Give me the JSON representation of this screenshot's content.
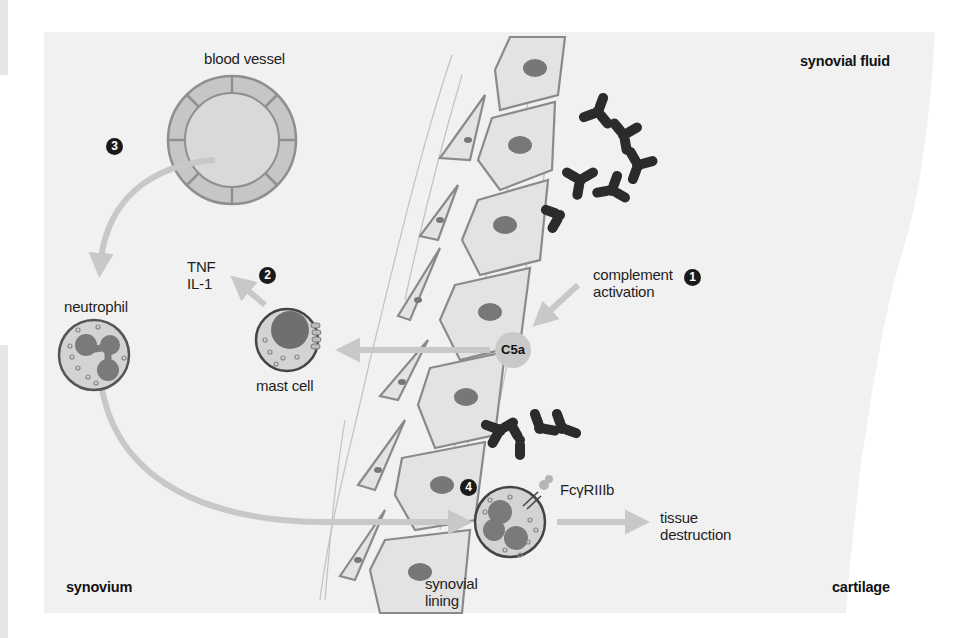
{
  "figure": {
    "regions": {
      "synovial_fluid": "synovial fluid",
      "synovium": "synovium",
      "cartilage": "cartilage",
      "synovial_lining": "synovial\nlining"
    },
    "structures": {
      "blood_vessel": "blood vessel",
      "neutrophil": "neutrophil",
      "mast_cell": "mast cell",
      "cytokines": "TNF\nIL-1",
      "complement_activation": "complement\nactivation",
      "c5a": "C5a",
      "receptor": "FcγRIIIb",
      "tissue_destruction": "tissue\ndestruction"
    },
    "steps": [
      "1",
      "2",
      "3",
      "4"
    ],
    "icons": {
      "immune_complex_upper": "antibody-immune-complex-icon",
      "immune_complex_lower": "antibody-immune-complex-icon",
      "step_marker": "numbered-circle-icon"
    },
    "colors": {
      "background_tissue": "#f1f1f1",
      "cell_fill": "#dedede",
      "cell_outline": "#8a8a8a",
      "nucleus": "#777777",
      "arrow": "#c8c8c8",
      "antibody": "#2b2b2b",
      "text": "#1e1e1e"
    }
  }
}
